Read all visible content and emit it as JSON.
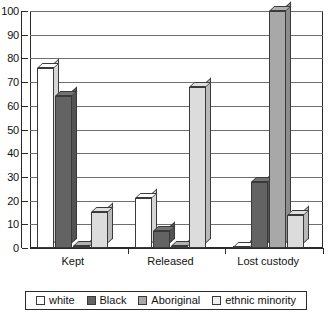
{
  "chart_data": {
    "type": "bar",
    "title": "",
    "subtitle": "",
    "xlabel": "",
    "ylabel": "",
    "categories": [
      "Kept",
      "Released",
      "Lost custody"
    ],
    "series": [
      {
        "name": "white",
        "color": "#ffffff",
        "values": [
          76,
          21,
          0
        ]
      },
      {
        "name": "Black",
        "color": "#636363",
        "values": [
          64,
          7,
          28
        ]
      },
      {
        "name": "Aboriginal",
        "color": "#a8a8a8",
        "values": [
          1,
          1,
          100
        ]
      },
      {
        "name": "ethnic minority",
        "color": "#dcdcdc",
        "values": [
          15,
          68,
          14
        ]
      }
    ],
    "ylim": [
      0,
      100
    ],
    "yticks": [
      0,
      10,
      20,
      30,
      40,
      50,
      60,
      70,
      80,
      90,
      100
    ],
    "ytick_labels": [
      "0",
      "10",
      "20",
      "30",
      "40",
      "50",
      "60",
      "70",
      "80",
      "90",
      "100"
    ],
    "grid": true,
    "legend_position": "bottom",
    "style": "3d-column"
  },
  "legend": {
    "items": [
      {
        "label": "white",
        "swatch_color": "#ffffff"
      },
      {
        "label": "Black",
        "swatch_color": "#636363"
      },
      {
        "label": "Aboriginal",
        "swatch_color": "#a8a8a8"
      },
      {
        "label": "ethnic minority",
        "swatch_color": "#efefef"
      }
    ]
  }
}
